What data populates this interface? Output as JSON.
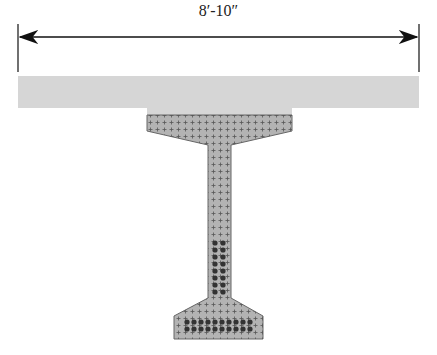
{
  "diagram": {
    "type": "bridge girder cross-section",
    "dimension": {
      "label": "8′-10″",
      "x1": 18,
      "x2": 419,
      "y": 37
    },
    "slab": {
      "name": "deck slab",
      "color": "#d6d6d6"
    },
    "girder": {
      "name": "prestressed I-girder",
      "color": "#b3b3b3",
      "outline": "#666666"
    },
    "strands": {
      "color": "#333333",
      "web_rows": 8,
      "bottom_rows": 2,
      "bottom_cols": 10
    },
    "mesh_marks": {
      "symbol": "+",
      "color": "#555555"
    }
  }
}
